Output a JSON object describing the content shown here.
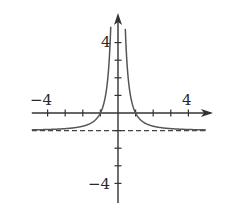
{
  "chart_data": {
    "type": "line",
    "title": "",
    "xlabel": "",
    "ylabel": "",
    "function": "y = 1/x^2 - 1",
    "xlim": [
      -4.9,
      5.3
    ],
    "ylim": [
      -5.0,
      5.6
    ],
    "grid": false,
    "legend": null,
    "x_ticks": [
      -4,
      -3,
      -2,
      -1,
      1,
      2,
      3,
      4
    ],
    "y_ticks": [
      -4,
      -3,
      -2,
      -1,
      1,
      2,
      3,
      4
    ],
    "tick_labels": {
      "x": [
        "-4",
        "4"
      ],
      "y": [
        "4",
        "-4"
      ]
    },
    "asymptotes": [
      {
        "type": "horizontal",
        "y": -1,
        "style": "dashed"
      },
      {
        "type": "vertical",
        "x": 0,
        "style": "none"
      }
    ],
    "series": [
      {
        "name": "f(x)",
        "x": [
          -4.9,
          -4,
          -3,
          -2,
          -1.5,
          -1,
          -0.75,
          -0.6,
          -0.5,
          -0.45,
          0.45,
          0.5,
          0.6,
          0.75,
          1,
          1.5,
          2,
          3,
          4,
          5.3
        ],
        "y": [
          -0.958,
          -0.9375,
          -0.889,
          -0.75,
          -0.556,
          0,
          0.778,
          1.778,
          3,
          3.94,
          3.94,
          3,
          1.778,
          0.778,
          0,
          -0.556,
          -0.75,
          -0.889,
          -0.9375,
          -0.964
        ]
      }
    ]
  },
  "labels": {
    "x_neg": "−4",
    "x_pos": "4",
    "y_pos": "4",
    "y_neg": "−4"
  },
  "colors": {
    "curve": "#555555",
    "axis": "#333333",
    "asymptote": "#444444"
  }
}
